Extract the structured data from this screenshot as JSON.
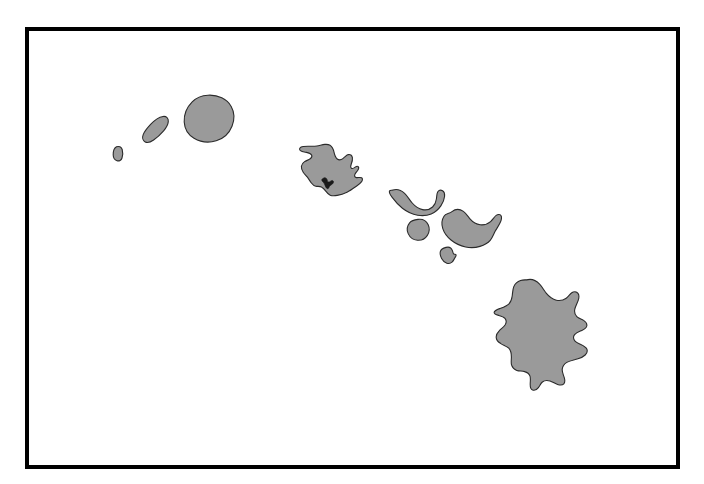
{
  "map": {
    "title": "Hawaiian Islands",
    "region": "Hawaii",
    "projection_note": "",
    "frame": {
      "border_color": "#000000",
      "border_width_px": 4,
      "x": 25,
      "y": 27,
      "width": 655,
      "height": 442
    },
    "background_color": "#ffffff",
    "island_fill_color": "#9a9a9a",
    "island_outline_color": "#2b2b2b",
    "marker_color": "#1a1a1a",
    "islands": [
      {
        "id": "kaula",
        "name": "Kaula",
        "label": "",
        "bbox": [
          113,
          146,
          10,
          15
        ]
      },
      {
        "id": "niihau",
        "name": "Niihau",
        "label": "",
        "bbox": [
          142,
          116,
          27,
          27
        ]
      },
      {
        "id": "kauai",
        "name": "Kauai",
        "label": "",
        "bbox": [
          184,
          95,
          50,
          47
        ]
      },
      {
        "id": "oahu",
        "name": "Oahu",
        "label": "",
        "bbox": [
          299,
          145,
          64,
          52
        ]
      },
      {
        "id": "molokai",
        "name": "Molokai",
        "label": "",
        "bbox": [
          389,
          189,
          56,
          27
        ]
      },
      {
        "id": "lanai",
        "name": "Lanai",
        "label": "",
        "bbox": [
          407,
          219,
          22,
          22
        ]
      },
      {
        "id": "maui",
        "name": "Maui",
        "label": "",
        "bbox": [
          442,
          209,
          59,
          39
        ]
      },
      {
        "id": "kahoolawe",
        "name": "Kahoolawe",
        "label": "",
        "bbox": [
          439,
          247,
          17,
          17
        ]
      },
      {
        "id": "hawaii",
        "name": "Hawaii (Big Island)",
        "label": "",
        "bbox": [
          494,
          279,
          102,
          112
        ]
      }
    ],
    "markers": [
      {
        "id": "pearl-harbor",
        "name": "Pearl Harbor",
        "label": "",
        "x": 327,
        "y": 180
      }
    ]
  }
}
